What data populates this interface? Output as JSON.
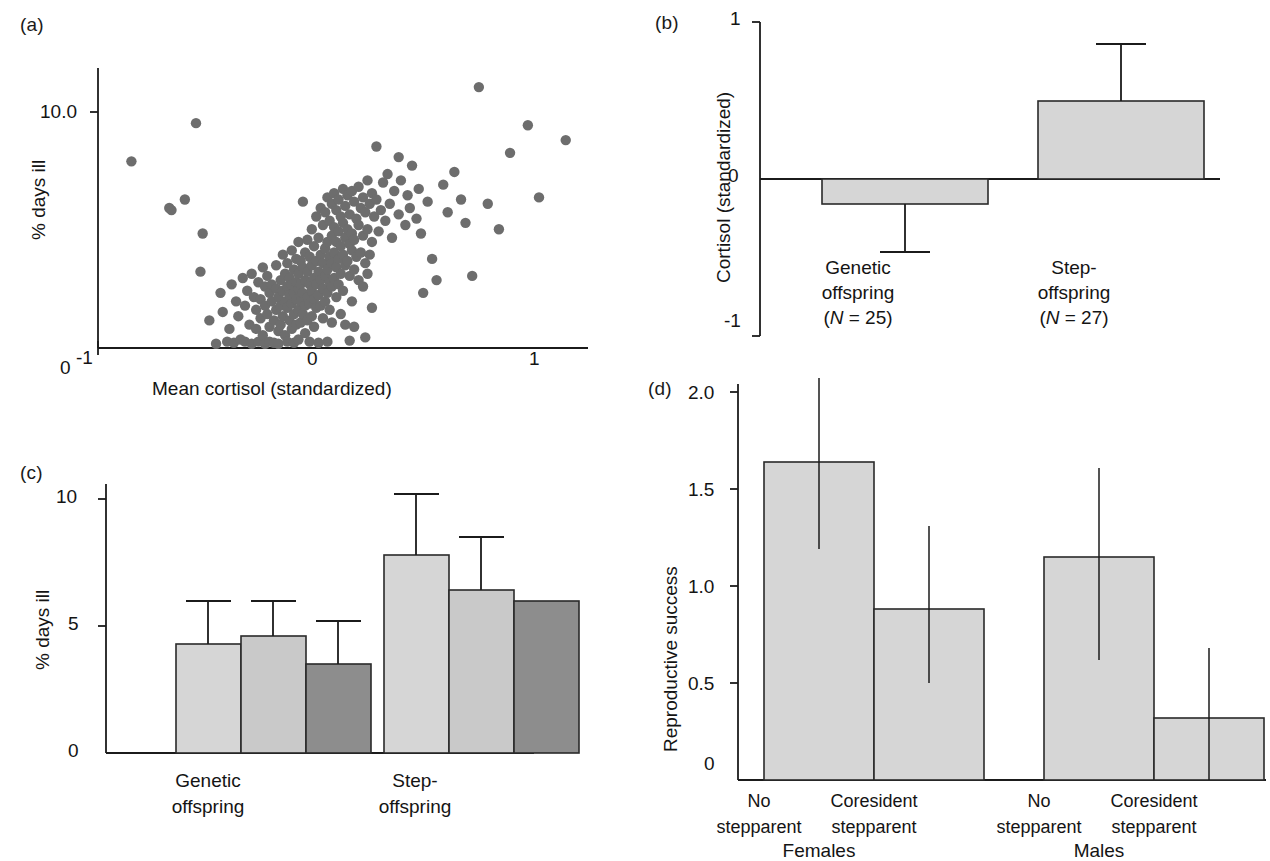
{
  "figure": {
    "panels": [
      "(a)",
      "(b)",
      "(c)",
      "(d)"
    ]
  },
  "panel_a": {
    "label": "(a)",
    "xlabel": "Mean cortisol (standardized)",
    "ylabel": "% days ill",
    "xticks": [
      "-1",
      "0",
      "1"
    ],
    "yticks": [
      "10.0"
    ],
    "origin_label": "0"
  },
  "panel_b": {
    "label": "(b)",
    "ylabel": "Cortisol (standardized)",
    "yticks": [
      "1",
      "0",
      "-1"
    ],
    "cat1_line1": "Genetic",
    "cat1_line2": "offspring",
    "cat1_n_pre": "(",
    "cat1_n_italic": "N",
    "cat1_n_post": " = 25)",
    "cat2_line1": "Step-",
    "cat2_line2": "offspring",
    "cat2_n_pre": "(",
    "cat2_n_italic": "N",
    "cat2_n_post": " = 27)"
  },
  "panel_c": {
    "label": "(c)",
    "ylabel": "% days ill",
    "yticks": [
      "10",
      "5",
      "0"
    ],
    "cat1_line1": "Genetic",
    "cat1_line2": "offspring",
    "cat2_line1": "Step-",
    "cat2_line2": "offspring"
  },
  "panel_d": {
    "label": "(d)",
    "ylabel": "Reproductive success",
    "yticks": [
      "2.0",
      "1.5",
      "1.0",
      "0.5",
      "0"
    ],
    "groups": [
      "Females",
      "Males"
    ],
    "bar_labels": [
      {
        "line1": "No",
        "line2": "stepparent"
      },
      {
        "line1": "Coresident",
        "line2": "stepparent"
      },
      {
        "line1": "No",
        "line2": "stepparent"
      },
      {
        "line1": "Coresident",
        "line2": "stepparent"
      }
    ]
  },
  "colors": {
    "dot": "#6d6d6d",
    "bar_light": "#d6d6d6",
    "bar_mid": "#c9c9c9",
    "bar_dark": "#8d8d8d",
    "axis": "#1b1b1b",
    "text": "#141414"
  },
  "chart_data": [
    {
      "id": "a",
      "type": "scatter",
      "title": "(a)",
      "xlabel": "Mean cortisol (standardized)",
      "ylabel": "% days ill",
      "xlim": [
        -1.05,
        1.15
      ],
      "ylim": [
        0,
        13.2
      ],
      "xticks": [
        -1,
        0,
        1
      ],
      "yticks": [
        10.0
      ],
      "grid": false,
      "n_points": 233,
      "points": [
        [
          -0.9,
          8.8
        ],
        [
          -0.73,
          6.6
        ],
        [
          -0.72,
          6.5
        ],
        [
          -0.66,
          7.0
        ],
        [
          -0.61,
          10.6
        ],
        [
          -0.58,
          5.4
        ],
        [
          -0.59,
          3.6
        ],
        [
          -0.55,
          1.3
        ],
        [
          -0.52,
          0.2
        ],
        [
          -0.5,
          2.6
        ],
        [
          -0.49,
          1.7
        ],
        [
          -0.47,
          0.3
        ],
        [
          -0.46,
          0.9
        ],
        [
          -0.45,
          3.0
        ],
        [
          -0.44,
          0.25
        ],
        [
          -0.43,
          2.2
        ],
        [
          -0.42,
          1.5
        ],
        [
          -0.41,
          0.4
        ],
        [
          -0.4,
          3.3
        ],
        [
          -0.39,
          2.0
        ],
        [
          -0.39,
          0.3
        ],
        [
          -0.38,
          2.7
        ],
        [
          -0.37,
          1.1
        ],
        [
          -0.36,
          3.5
        ],
        [
          -0.36,
          0.2
        ],
        [
          -0.35,
          2.4
        ],
        [
          -0.34,
          1.8
        ],
        [
          -0.34,
          0.9
        ],
        [
          -0.33,
          3.1
        ],
        [
          -0.33,
          0.3
        ],
        [
          -0.32,
          2.3
        ],
        [
          -0.32,
          1.4
        ],
        [
          -0.31,
          3.8
        ],
        [
          -0.31,
          0.6
        ],
        [
          -0.3,
          2.9
        ],
        [
          -0.3,
          2.0
        ],
        [
          -0.3,
          0.2
        ],
        [
          -0.29,
          3.4
        ],
        [
          -0.29,
          1.6
        ],
        [
          -0.28,
          2.6
        ],
        [
          -0.28,
          1.0
        ],
        [
          -0.28,
          0.3
        ],
        [
          -0.27,
          3.0
        ],
        [
          -0.27,
          2.2
        ],
        [
          -0.26,
          1.3
        ],
        [
          -0.26,
          0.25
        ],
        [
          -0.25,
          3.9
        ],
        [
          -0.25,
          2.8
        ],
        [
          -0.25,
          1.8
        ],
        [
          -0.24,
          2.4
        ],
        [
          -0.24,
          0.8
        ],
        [
          -0.24,
          0.2
        ],
        [
          -0.23,
          3.2
        ],
        [
          -0.23,
          2.0
        ],
        [
          -0.23,
          1.1
        ],
        [
          -0.22,
          4.4
        ],
        [
          -0.22,
          2.7
        ],
        [
          -0.22,
          1.5
        ],
        [
          -0.21,
          3.5
        ],
        [
          -0.21,
          2.2
        ],
        [
          -0.21,
          0.6
        ],
        [
          -0.2,
          4.0
        ],
        [
          -0.2,
          2.9
        ],
        [
          -0.2,
          1.9
        ],
        [
          -0.2,
          0.3
        ],
        [
          -0.19,
          3.3
        ],
        [
          -0.19,
          2.5
        ],
        [
          -0.19,
          1.3
        ],
        [
          -0.18,
          4.6
        ],
        [
          -0.18,
          3.0
        ],
        [
          -0.18,
          2.1
        ],
        [
          -0.18,
          0.9
        ],
        [
          -0.17,
          3.7
        ],
        [
          -0.17,
          2.6
        ],
        [
          -0.17,
          1.6
        ],
        [
          -0.17,
          0.25
        ],
        [
          -0.16,
          4.2
        ],
        [
          -0.16,
          3.1
        ],
        [
          -0.16,
          2.3
        ],
        [
          -0.16,
          1.1
        ],
        [
          -0.15,
          5.0
        ],
        [
          -0.15,
          3.5
        ],
        [
          -0.15,
          2.8
        ],
        [
          -0.15,
          1.8
        ],
        [
          -0.15,
          0.4
        ],
        [
          -0.14,
          4.1
        ],
        [
          -0.14,
          3.0
        ],
        [
          -0.14,
          2.2
        ],
        [
          -0.14,
          1.2
        ],
        [
          -0.13,
          6.9
        ],
        [
          -0.13,
          3.8
        ],
        [
          -0.13,
          2.6
        ],
        [
          -0.13,
          1.6
        ],
        [
          -0.12,
          4.5
        ],
        [
          -0.12,
          3.2
        ],
        [
          -0.12,
          2.0
        ],
        [
          -0.12,
          0.7
        ],
        [
          -0.11,
          5.1
        ],
        [
          -0.11,
          3.6
        ],
        [
          -0.11,
          2.4
        ],
        [
          -0.11,
          1.3
        ],
        [
          -0.1,
          4.3
        ],
        [
          -0.1,
          3.0
        ],
        [
          -0.1,
          2.1
        ],
        [
          -0.1,
          0.3
        ],
        [
          -0.09,
          5.6
        ],
        [
          -0.09,
          3.9
        ],
        [
          -0.09,
          2.7
        ],
        [
          -0.09,
          1.5
        ],
        [
          -0.08,
          4.8
        ],
        [
          -0.08,
          3.3
        ],
        [
          -0.08,
          2.3
        ],
        [
          -0.08,
          1.0
        ],
        [
          -0.07,
          6.2
        ],
        [
          -0.07,
          4.1
        ],
        [
          -0.07,
          3.0
        ],
        [
          -0.07,
          1.9
        ],
        [
          -0.06,
          5.2
        ],
        [
          -0.06,
          3.6
        ],
        [
          -0.06,
          2.5
        ],
        [
          -0.06,
          0.25
        ],
        [
          -0.05,
          6.6
        ],
        [
          -0.05,
          4.4
        ],
        [
          -0.05,
          3.2
        ],
        [
          -0.05,
          2.0
        ],
        [
          -0.04,
          5.8
        ],
        [
          -0.04,
          4.0
        ],
        [
          -0.04,
          2.8
        ],
        [
          -0.04,
          1.4
        ],
        [
          -0.03,
          6.4
        ],
        [
          -0.03,
          4.7
        ],
        [
          -0.03,
          3.4
        ],
        [
          -0.03,
          2.2
        ],
        [
          -0.02,
          7.1
        ],
        [
          -0.02,
          5.0
        ],
        [
          -0.02,
          3.7
        ],
        [
          -0.02,
          2.6
        ],
        [
          -0.02,
          0.3
        ],
        [
          -0.01,
          6.0
        ],
        [
          -0.01,
          4.3
        ],
        [
          -0.01,
          3.1
        ],
        [
          -0.01,
          1.8
        ],
        [
          0.0,
          6.8
        ],
        [
          0.0,
          5.3
        ],
        [
          0.0,
          4.0
        ],
        [
          0.0,
          2.9
        ],
        [
          0.0,
          1.2
        ],
        [
          0.01,
          7.3
        ],
        [
          0.01,
          5.7
        ],
        [
          0.01,
          4.5
        ],
        [
          0.01,
          3.3
        ],
        [
          0.02,
          6.5
        ],
        [
          0.02,
          5.0
        ],
        [
          0.02,
          3.8
        ],
        [
          0.02,
          2.4
        ],
        [
          0.03,
          7.0
        ],
        [
          0.03,
          5.5
        ],
        [
          0.03,
          4.2
        ],
        [
          0.03,
          3.0
        ],
        [
          0.04,
          6.2
        ],
        [
          0.04,
          4.8
        ],
        [
          0.04,
          3.5
        ],
        [
          0.04,
          1.6
        ],
        [
          0.05,
          7.5
        ],
        [
          0.05,
          5.9
        ],
        [
          0.05,
          4.4
        ],
        [
          0.05,
          2.7
        ],
        [
          0.06,
          6.7
        ],
        [
          0.06,
          5.2
        ],
        [
          0.06,
          3.9
        ],
        [
          0.06,
          1.1
        ],
        [
          0.07,
          7.2
        ],
        [
          0.07,
          5.6
        ],
        [
          0.07,
          4.1
        ],
        [
          0.08,
          6.3
        ],
        [
          0.08,
          4.9
        ],
        [
          0.08,
          3.4
        ],
        [
          0.08,
          0.35
        ],
        [
          0.09,
          7.4
        ],
        [
          0.09,
          5.4
        ],
        [
          0.09,
          4.6
        ],
        [
          0.09,
          2.2
        ],
        [
          0.1,
          6.9
        ],
        [
          0.1,
          5.1
        ],
        [
          0.1,
          3.7
        ],
        [
          0.1,
          1.0
        ],
        [
          0.11,
          6.1
        ],
        [
          0.11,
          4.3
        ],
        [
          0.12,
          7.6
        ],
        [
          0.12,
          5.8
        ],
        [
          0.12,
          3.2
        ],
        [
          0.13,
          6.6
        ],
        [
          0.13,
          4.5
        ],
        [
          0.14,
          7.1
        ],
        [
          0.14,
          5.3
        ],
        [
          0.14,
          2.9
        ],
        [
          0.15,
          6.4
        ],
        [
          0.15,
          4.0
        ],
        [
          0.15,
          0.5
        ],
        [
          0.16,
          7.9
        ],
        [
          0.16,
          5.6
        ],
        [
          0.16,
          3.5
        ],
        [
          0.17,
          6.8
        ],
        [
          0.17,
          4.4
        ],
        [
          0.18,
          7.3
        ],
        [
          0.18,
          5.0
        ],
        [
          0.18,
          1.9
        ],
        [
          0.19,
          6.2
        ],
        [
          0.2,
          9.5
        ],
        [
          0.2,
          7.0
        ],
        [
          0.21,
          5.5
        ],
        [
          0.22,
          6.5
        ],
        [
          0.23,
          7.8
        ],
        [
          0.24,
          6.0
        ],
        [
          0.25,
          8.2
        ],
        [
          0.26,
          6.8
        ],
        [
          0.27,
          5.2
        ],
        [
          0.28,
          7.4
        ],
        [
          0.3,
          9.0
        ],
        [
          0.3,
          6.3
        ],
        [
          0.31,
          7.9
        ],
        [
          0.33,
          5.8
        ],
        [
          0.34,
          7.2
        ],
        [
          0.35,
          6.6
        ],
        [
          0.36,
          8.6
        ],
        [
          0.38,
          6.1
        ],
        [
          0.39,
          7.5
        ],
        [
          0.4,
          5.4
        ],
        [
          0.41,
          2.6
        ],
        [
          0.43,
          6.9
        ],
        [
          0.45,
          4.2
        ],
        [
          0.47,
          3.2
        ],
        [
          0.5,
          7.7
        ],
        [
          0.52,
          6.4
        ],
        [
          0.55,
          8.3
        ],
        [
          0.58,
          7.0
        ],
        [
          0.6,
          5.9
        ],
        [
          0.63,
          3.4
        ],
        [
          0.66,
          12.3
        ],
        [
          0.7,
          6.8
        ],
        [
          0.75,
          5.6
        ],
        [
          0.8,
          9.2
        ],
        [
          0.88,
          10.5
        ],
        [
          0.93,
          7.1
        ],
        [
          1.05,
          9.8
        ]
      ]
    },
    {
      "id": "b",
      "type": "bar",
      "title": "(b)",
      "ylabel": "Cortisol (standardized)",
      "xlabel": "",
      "categories": [
        "Genetic offspring (N = 25)",
        "Step-offspring (N = 27)"
      ],
      "values": [
        -0.16,
        0.5
      ],
      "errors_low": [
        -0.46,
        0.5
      ],
      "errors_high": [
        -0.16,
        0.86
      ],
      "ylim": [
        -1,
        1
      ],
      "yticks": [
        1,
        0,
        -1
      ],
      "sample_sizes": [
        25,
        27
      ],
      "grid": false
    },
    {
      "id": "c",
      "type": "bar",
      "title": "(c)",
      "ylabel": "% days ill",
      "xlabel": "",
      "categories": [
        "Genetic offspring",
        "Step-offspring"
      ],
      "series": [
        {
          "name": "bar-1",
          "shade": "light",
          "values": [
            4.3,
            7.8
          ],
          "error_high": [
            6.0,
            10.2
          ]
        },
        {
          "name": "bar-2",
          "shade": "light",
          "values": [
            4.6,
            6.4
          ],
          "error_high": [
            6.0,
            8.5
          ]
        },
        {
          "name": "bar-3",
          "shade": "dark",
          "values": [
            3.5,
            6.0
          ],
          "error_high": [
            5.2,
            null
          ]
        }
      ],
      "ylim": [
        0,
        11
      ],
      "yticks": [
        10,
        5,
        0
      ],
      "grid": false
    },
    {
      "id": "d",
      "type": "bar",
      "title": "(d)",
      "ylabel": "Reproductive success",
      "xlabel": "",
      "groups": [
        "Females",
        "Males"
      ],
      "categories": [
        "No stepparent",
        "Coresident stepparent",
        "No stepparent",
        "Coresident stepparent"
      ],
      "values": [
        1.64,
        0.88,
        1.15,
        0.32
      ],
      "errors_low": [
        1.19,
        0.5,
        0.62,
        0.32
      ],
      "errors_high": [
        2.07,
        1.31,
        1.61,
        0.68
      ],
      "ylim": [
        0,
        2.15
      ],
      "yticks": [
        2.0,
        1.5,
        1.0,
        0.5,
        0
      ],
      "grid": false
    }
  ]
}
